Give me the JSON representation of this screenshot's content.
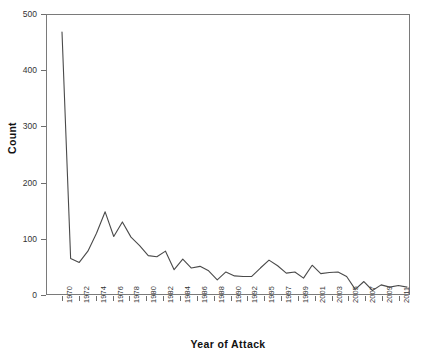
{
  "chart_data": {
    "type": "line",
    "title": "",
    "xlabel": "Year of Attack",
    "ylabel": "Count",
    "grid": false,
    "legend": "none",
    "xlim": [
      1970,
      2011
    ],
    "ylim": [
      0,
      500
    ],
    "y_ticks": [
      0,
      100,
      200,
      300,
      400,
      500
    ],
    "x_tick_labels": [
      "1970",
      "1972",
      "1974",
      "1976",
      "1978",
      "1980",
      "1982",
      "1984",
      "1986",
      "1988",
      "1990",
      "1992",
      "1995",
      "1997",
      "1999",
      "2001",
      "2003",
      "2005",
      "2007",
      "2009",
      "2011"
    ],
    "line_color": "#4a4a4a",
    "categories": [
      1970,
      1971,
      1972,
      1973,
      1974,
      1975,
      1976,
      1977,
      1978,
      1979,
      1980,
      1981,
      1982,
      1983,
      1984,
      1985,
      1986,
      1987,
      1988,
      1989,
      1990,
      1991,
      1992,
      1994,
      1995,
      1996,
      1997,
      1998,
      1999,
      2000,
      2001,
      2002,
      2003,
      2004,
      2005,
      2006,
      2007,
      2008,
      2009,
      2010,
      2011
    ],
    "values": [
      468,
      65,
      58,
      78,
      110,
      148,
      104,
      130,
      103,
      88,
      70,
      68,
      78,
      45,
      64,
      48,
      51,
      43,
      27,
      41,
      34,
      33,
      33,
      48,
      62,
      52,
      39,
      41,
      30,
      53,
      38,
      40,
      41,
      33,
      10,
      24,
      8,
      18,
      14,
      17,
      14
    ],
    "series": [
      {
        "name": "Count",
        "values": [
          468,
          65,
          58,
          78,
          110,
          148,
          104,
          130,
          103,
          88,
          70,
          68,
          78,
          45,
          64,
          48,
          51,
          43,
          27,
          41,
          34,
          33,
          33,
          48,
          62,
          52,
          39,
          41,
          30,
          53,
          38,
          40,
          41,
          33,
          10,
          24,
          8,
          18,
          14,
          17,
          14
        ]
      }
    ]
  }
}
